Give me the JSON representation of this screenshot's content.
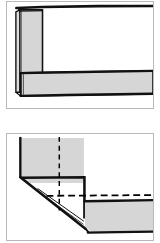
{
  "document": {
    "kind": "technical-line-drawing",
    "page_background": "#ffffff",
    "width_px": 160,
    "height_px": 243,
    "panel_count": 2
  },
  "style": {
    "fabric_fill": "#d6d6d6",
    "fabric_fill_light": "#dedede",
    "outline_color": "#111111",
    "panel_border_color": "#b9b9b9",
    "stitch_color": "#000000",
    "background": "#ffffff"
  },
  "panels": [
    {
      "id": "panel-top",
      "name": "unmitered-corner-view",
      "description": "Folded hem corner with vertical band and horizontal band meeting at a square corner",
      "shapes": [
        {
          "name": "vertical-hem-band",
          "type": "folded-strip",
          "orientation": "vertical",
          "fill": "#d6d6d6"
        },
        {
          "name": "horizontal-hem-band",
          "type": "folded-strip",
          "orientation": "horizontal",
          "fill": "#d6d6d6"
        },
        {
          "name": "top-fabric-edge-line",
          "type": "heavy-edge-line"
        },
        {
          "name": "fold-crease-line",
          "type": "thin-fold-line"
        }
      ]
    },
    {
      "id": "panel-bottom",
      "name": "mitered-corner-view",
      "description": "Mitered corner with diagonal fold, dashed vertical seam line and dashed horizontal stitch line",
      "shapes": [
        {
          "name": "mitered-fabric-body",
          "type": "polygon-fabric",
          "fill": "#d6d6d6"
        },
        {
          "name": "lower-hem-band",
          "type": "folded-strip",
          "orientation": "horizontal",
          "fill": "#d6d6d6"
        },
        {
          "name": "diagonal-miter-fold",
          "type": "heavy-edge-line"
        },
        {
          "name": "vertical-dashed-seam",
          "type": "dashed-line",
          "orientation": "vertical"
        },
        {
          "name": "horizontal-dashed-stitch",
          "type": "dashed-line",
          "orientation": "horizontal"
        }
      ]
    }
  ]
}
